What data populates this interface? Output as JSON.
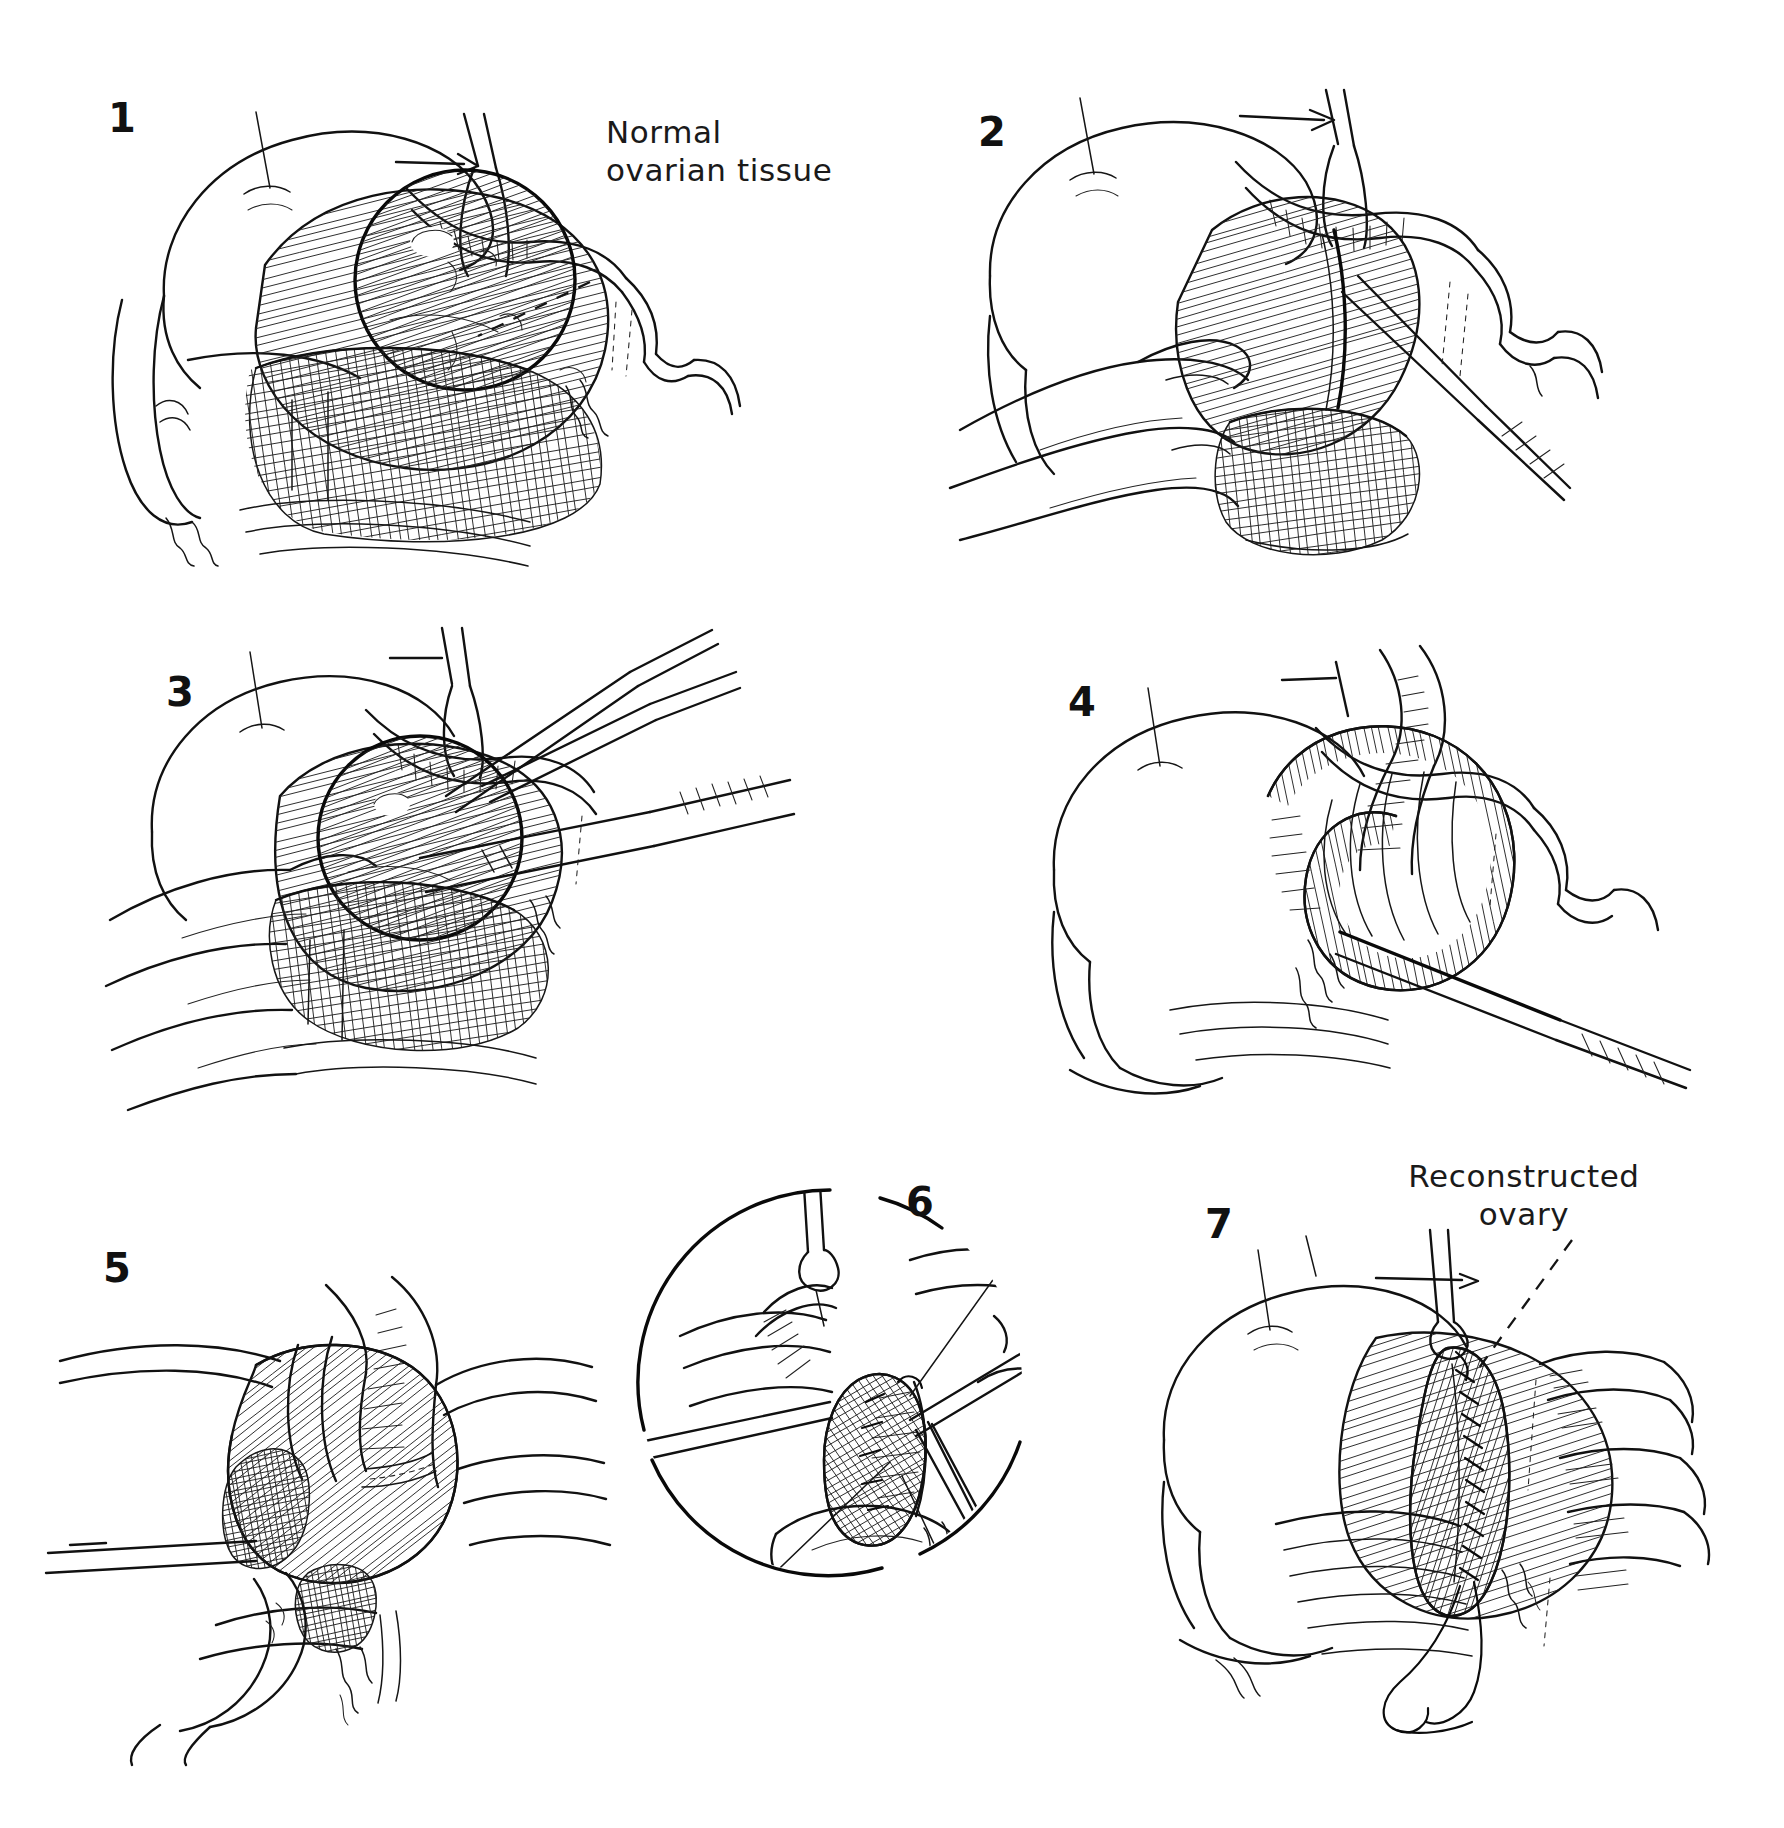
{
  "plate": {
    "title": "Ovarian cystectomy with ovarian reconstruction",
    "background_color": "#ffffff",
    "ink_color": "#111111",
    "width": 1784,
    "height": 1828,
    "panel_count": 7
  },
  "panels": [
    {
      "number": "1",
      "num_x": 108,
      "num_y": 98,
      "caption": "Uterus and enlarged ovarian cyst in situ; normal ovarian tissue stretched over the cyst surface",
      "content": "uterus-with-ovarian-cyst"
    },
    {
      "number": "2",
      "num_x": 978,
      "num_y": 112,
      "caption": "Surgeon's fingers stabilize the ovary while the cortex is incised with a scalpel",
      "content": "incising-ovarian-cortex"
    },
    {
      "number": "3",
      "num_x": 166,
      "num_y": 672,
      "caption": "Blunt and sharp dissection of the cyst wall from the ovarian cortex with forceps and scissors",
      "content": "dissecting-cyst-wall"
    },
    {
      "number": "4",
      "num_x": 1068,
      "num_y": 682,
      "caption": "Cyst wall completely enucleated, leaving the open ovarian cortical shell",
      "content": "enucleated-cyst-bed"
    },
    {
      "number": "5",
      "num_x": 103,
      "num_y": 1248,
      "caption": "Redundant ovarian capsule trimmed; hemostasis obtained in the ovarian bed",
      "content": "trimming-ovarian-capsule"
    },
    {
      "number": "6",
      "num_x": 906,
      "num_y": 1182,
      "caption": "Magnified inset: closure of the ovarian defect with fine interrupted sutures",
      "content": "suturing-ovarian-defect-inset",
      "inset": true
    },
    {
      "number": "7",
      "num_x": 1205,
      "num_y": 1204,
      "caption": "Completed repair: the ovary is reconstructed with a continuous suture line",
      "content": "reconstructed-ovary-final"
    }
  ],
  "callouts": [
    {
      "id": "normal-ovarian-tissue",
      "text": "Normal\novarian tissue",
      "x": 606,
      "y": 114,
      "align": "left",
      "leader": {
        "from_x": 590,
        "from_y": 278,
        "to_x": 482,
        "to_y": 330
      }
    },
    {
      "id": "reconstructed-ovary",
      "text": "Reconstructed\novary",
      "x": 1522,
      "y": 1158,
      "align": "center",
      "leader": {
        "from_x": 1570,
        "from_y": 1238,
        "to_x": 1478,
        "to_y": 1368
      }
    }
  ]
}
